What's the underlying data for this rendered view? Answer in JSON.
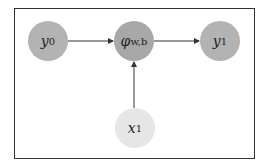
{
  "diagram": {
    "nodes": [
      {
        "id": "y0",
        "label": "y",
        "sub": "0",
        "color": "#b3b3b3"
      },
      {
        "id": "phi",
        "label": "φ",
        "sub": "w,b",
        "color": "#a8a8a8"
      },
      {
        "id": "y1",
        "label": "y",
        "sub": "1",
        "color": "#b3b3b3"
      },
      {
        "id": "x1",
        "label": "x",
        "sub": "1",
        "color": "#e6e6e6"
      }
    ],
    "edges": [
      {
        "from": "y0",
        "to": "phi"
      },
      {
        "from": "phi",
        "to": "y1"
      },
      {
        "from": "x1",
        "to": "phi"
      }
    ]
  }
}
